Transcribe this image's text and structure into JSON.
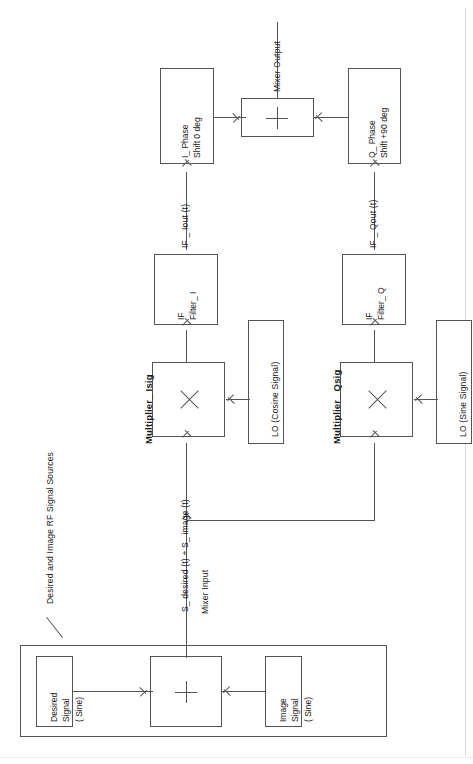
{
  "diagram": {
    "orientation": "rotated-90-ccw",
    "annotation_group": "Desired and Image RF Signal Sources",
    "blocks": {
      "desired_signal": {
        "line1": "Desired",
        "line2": "Signal",
        "line3": "( Sine)"
      },
      "image_signal": {
        "line1": "Image",
        "line2": "Signal",
        "line3": "( Sine)"
      },
      "rf_summer": {
        "symbol": "+"
      },
      "multiplier_i": {
        "name": "Multiplier_ Isig",
        "symbol": "X"
      },
      "multiplier_q": {
        "name": "Multiplier_ Qsig",
        "symbol": "X"
      },
      "lo_cosine": {
        "label": "LO  (Cosine Signal)"
      },
      "lo_sine": {
        "label": "LO  (Sine Signal)"
      },
      "if_filter_i": {
        "line1": "IF",
        "line2": "Filter_ I"
      },
      "if_filter_q": {
        "line1": "IF",
        "line2": "Filter_ Q"
      },
      "i_phase": {
        "line1": "I_ Phase",
        "line2": "Shift 0 deg"
      },
      "q_phase": {
        "line1": "Q_ Phase",
        "line2": "Shift +90 deg"
      },
      "output_summer": {
        "symbol": "+"
      }
    },
    "signal_labels": {
      "mixer_input": "Mixer Input",
      "rf_sum": "S_ desired (t)  + S_ image (t)",
      "if_iout": "IF _ Iout (t)",
      "if_qout": "IF _ Qout (t)",
      "mixer_output": "Mixer Output"
    },
    "colors": {
      "stroke": "#555555",
      "text": "#1a1a1a",
      "background": "#ffffff"
    }
  }
}
